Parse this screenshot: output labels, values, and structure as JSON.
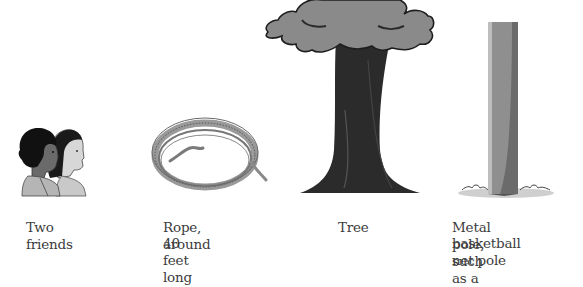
{
  "items": [
    {
      "id": "friends",
      "caption": "Two friends"
    },
    {
      "id": "rope",
      "caption_line1": "Rope, around",
      "caption_line2": "40 feet long"
    },
    {
      "id": "tree",
      "caption": "Tree"
    },
    {
      "id": "pole",
      "caption_line1": "Metal pole, such as a",
      "caption_line2": "basketball net pole"
    }
  ]
}
